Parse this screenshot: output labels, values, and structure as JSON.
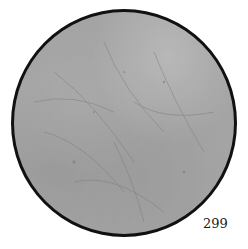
{
  "image": {
    "description": "Circular grayscale micrograph-like textured disc with a dark border",
    "colors": {
      "background": "#ffffff",
      "disc_fill": "#a4a4a4",
      "disc_border": "#111111",
      "label_color": "#1a1a1a"
    }
  },
  "label": {
    "number": "299"
  }
}
